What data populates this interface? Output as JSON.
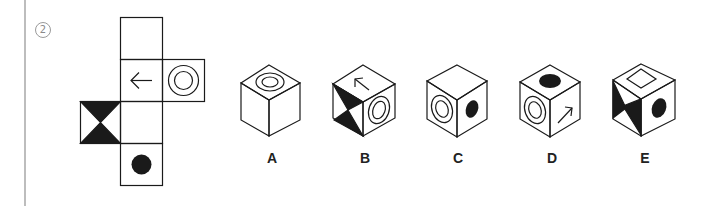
{
  "question": {
    "number": "2"
  },
  "net": {
    "faces": [
      {
        "position": "top",
        "symbol": "blank"
      },
      {
        "position": "second",
        "symbol": "arrow-left"
      },
      {
        "position": "right-of-second",
        "symbol": "concentric-circles"
      },
      {
        "position": "left-of-third",
        "symbol": "black-hourglass"
      },
      {
        "position": "third",
        "symbol": "blank"
      },
      {
        "position": "bottom",
        "symbol": "black-dot"
      }
    ]
  },
  "options": [
    {
      "label": "A",
      "top": "concentric-circles",
      "left": "blank",
      "right": "blank"
    },
    {
      "label": "B",
      "top": "arrow",
      "left": "black-hourglass",
      "right": "concentric-circles"
    },
    {
      "label": "C",
      "top": "blank",
      "left": "concentric-circles",
      "right": "black-dot"
    },
    {
      "label": "D",
      "top": "black-dot",
      "left": "concentric-circles",
      "right": "arrow"
    },
    {
      "label": "E",
      "top": "square",
      "left": "black-hourglass",
      "right": "black-dot"
    }
  ],
  "colors": {
    "ink": "#1a1a1a",
    "rule": "#bdbdbd"
  }
}
